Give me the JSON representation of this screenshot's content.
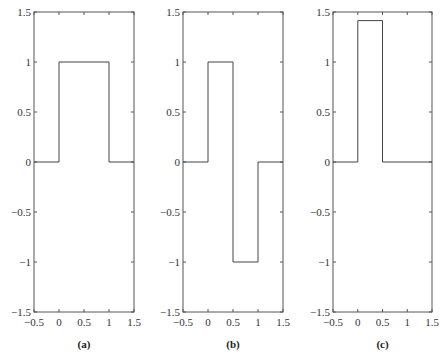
{
  "chart_data": [
    {
      "type": "line",
      "panel": "a",
      "caption": "(a)",
      "title": "",
      "xlabel": "",
      "ylabel": "",
      "xlim": [
        -0.5,
        1.5
      ],
      "ylim": [
        -1.5,
        1.5
      ],
      "xticks": [
        -0.5,
        0,
        0.5,
        1,
        1.5
      ],
      "yticks": [
        -1.5,
        -1,
        -0.5,
        0,
        0.5,
        1,
        1.5
      ],
      "xtick_labels": [
        "−0.5",
        "0",
        "0.5",
        "1",
        "1.5"
      ],
      "ytick_labels": [
        "−1.5",
        "−1",
        "−0.5",
        "0",
        "0.5",
        "1",
        "1.5"
      ],
      "grid": false,
      "step": true,
      "x": [
        -0.5,
        0,
        0,
        1,
        1,
        1.5
      ],
      "y": [
        0,
        0,
        1,
        1,
        0,
        0
      ]
    },
    {
      "type": "line",
      "panel": "b",
      "caption": "(b)",
      "title": "",
      "xlabel": "",
      "ylabel": "",
      "xlim": [
        -0.5,
        1.5
      ],
      "ylim": [
        -1.5,
        1.5
      ],
      "xticks": [
        -0.5,
        0,
        0.5,
        1,
        1.5
      ],
      "yticks": [
        -1.5,
        -1,
        -0.5,
        0,
        0.5,
        1,
        1.5
      ],
      "xtick_labels": [
        "−0.5",
        "0",
        "0.5",
        "1",
        "1.5"
      ],
      "ytick_labels": [
        "−1.5",
        "−1",
        "−0.5",
        "0",
        "0.5",
        "1",
        "1.5"
      ],
      "grid": false,
      "step": true,
      "x": [
        -0.5,
        0,
        0,
        0.5,
        0.5,
        1,
        1,
        1.5
      ],
      "y": [
        0,
        0,
        1,
        1,
        -1,
        -1,
        0,
        0
      ]
    },
    {
      "type": "line",
      "panel": "c",
      "caption": "(c)",
      "title": "",
      "xlabel": "",
      "ylabel": "",
      "xlim": [
        -0.5,
        1.5
      ],
      "ylim": [
        -1.5,
        1.5
      ],
      "xticks": [
        -0.5,
        0,
        0.5,
        1,
        1.5
      ],
      "yticks": [
        -1.5,
        -1,
        -0.5,
        0,
        0.5,
        1,
        1.5
      ],
      "xtick_labels": [
        "−0.5",
        "0",
        "0.5",
        "1",
        "1.5"
      ],
      "ytick_labels": [
        "−1.5",
        "−1",
        "−0.5",
        "0",
        "0.5",
        "1",
        "1.5"
      ],
      "grid": false,
      "step": true,
      "x": [
        -0.5,
        0,
        0,
        0.5,
        0.5,
        1.5
      ],
      "y": [
        0,
        0,
        1.414,
        1.414,
        0,
        0
      ]
    }
  ],
  "layout": {
    "panels": [
      {
        "left": 34,
        "right": 134,
        "top": 12,
        "bottom": 312
      },
      {
        "left": 183,
        "right": 283,
        "top": 12,
        "bottom": 312
      },
      {
        "left": 333,
        "right": 432,
        "top": 12,
        "bottom": 312
      }
    ],
    "colors": {
      "axis": "#555555",
      "signal": "#444444",
      "text": "#333333"
    }
  }
}
